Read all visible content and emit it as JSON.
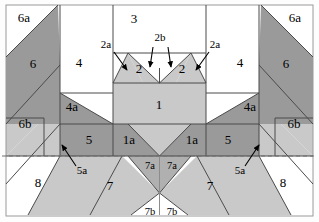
{
  "figure": {
    "width": 319,
    "height": 222,
    "background_color": "#fdfdfd",
    "frame_color": "#9a9a9a",
    "stroke_color": "#4a4a4a",
    "dashed_guide_color": "#707070"
  },
  "palette": {
    "white": "#ffffff",
    "light_gray": "#c9c9c9",
    "mid_gray": "#b0b0b0",
    "dark_gray": "#9a9a9a"
  },
  "regions": [
    {
      "id": "6a-left",
      "label": "6a",
      "fill": "white",
      "x": 24,
      "y": 19
    },
    {
      "id": "6a-right",
      "label": "6a",
      "fill": "white",
      "x": 295,
      "y": 19
    },
    {
      "id": "6-left",
      "label": "6",
      "fill": "dark_gray",
      "x": 33,
      "y": 65
    },
    {
      "id": "6-right",
      "label": "6",
      "fill": "dark_gray",
      "x": 286,
      "y": 65
    },
    {
      "id": "6b-left",
      "label": "6b",
      "fill": "light_gray",
      "x": 25,
      "y": 125
    },
    {
      "id": "6b-right",
      "label": "6b",
      "fill": "light_gray",
      "x": 294,
      "y": 125
    },
    {
      "id": "4-left",
      "label": "4",
      "fill": "white",
      "x": 79,
      "y": 64
    },
    {
      "id": "4-right",
      "label": "4",
      "fill": "white",
      "x": 240,
      "y": 64
    },
    {
      "id": "3",
      "label": "3",
      "fill": "white",
      "x": 134,
      "y": 20
    },
    {
      "id": "2-left",
      "label": "2",
      "fill": "light_gray",
      "x": 139,
      "y": 69
    },
    {
      "id": "2-right",
      "label": "2",
      "fill": "light_gray",
      "x": 182,
      "y": 69
    },
    {
      "id": "1",
      "label": "1",
      "fill": "light_gray",
      "x": 159,
      "y": 106
    },
    {
      "id": "4a-left",
      "label": "4a",
      "fill": "dark_gray",
      "x": 72,
      "y": 108
    },
    {
      "id": "4a-right",
      "label": "4a",
      "fill": "dark_gray",
      "x": 250,
      "y": 108
    },
    {
      "id": "5-left",
      "label": "5",
      "fill": "dark_gray",
      "x": 89,
      "y": 141
    },
    {
      "id": "5-right",
      "label": "5",
      "fill": "dark_gray",
      "x": 228,
      "y": 141
    },
    {
      "id": "1a-left",
      "label": "1a",
      "fill": "dark_gray",
      "x": 129,
      "y": 141
    },
    {
      "id": "1a-right",
      "label": "1a",
      "fill": "dark_gray",
      "x": 192,
      "y": 141
    },
    {
      "id": "7a-left",
      "label": "7a",
      "fill": "mid_gray",
      "x": 150,
      "y": 167
    },
    {
      "id": "7a-right",
      "label": "7a",
      "fill": "mid_gray",
      "x": 172,
      "y": 167
    },
    {
      "id": "7-left",
      "label": "7",
      "fill": "light_gray",
      "x": 110,
      "y": 187
    },
    {
      "id": "7-right",
      "label": "7",
      "fill": "light_gray",
      "x": 210,
      "y": 187
    },
    {
      "id": "7b-left",
      "label": "7b",
      "fill": "white",
      "x": 150,
      "y": 213
    },
    {
      "id": "7b-right",
      "label": "7b",
      "fill": "white",
      "x": 172,
      "y": 213
    },
    {
      "id": "8-left",
      "label": "8",
      "fill": "white",
      "x": 38,
      "y": 184
    },
    {
      "id": "8-right",
      "label": "8",
      "fill": "white",
      "x": 283,
      "y": 184
    }
  ],
  "callouts": [
    {
      "id": "2a-left",
      "label": "2a",
      "text_x": 106,
      "text_y": 45,
      "arrow": "M 114 52 L 128 69"
    },
    {
      "id": "2a-right",
      "label": "2a",
      "text_x": 215,
      "text_y": 45,
      "arrow": "M 209 52 L 194 69"
    },
    {
      "id": "2b-left",
      "label": "2b",
      "text_x": 160,
      "text_y": 40,
      "arrow": "M 153 47 L 150 66"
    },
    {
      "id": "2b-right",
      "label": "2b",
      "text_x": 160,
      "text_y": 40,
      "arrow": "M 168 47 L 170 66"
    },
    {
      "id": "5a-left",
      "label": "5a",
      "text_x": 82,
      "text_y": 170,
      "arrow": "M 74 165 L 61 146"
    },
    {
      "id": "5a-right",
      "label": "5a",
      "text_x": 240,
      "text_y": 170,
      "arrow": "M 247 165 L 261 146"
    }
  ],
  "geometry": {
    "frame": {
      "x": 6,
      "y": 5,
      "w": 307,
      "h": 211
    },
    "dashed_guide_y": 156,
    "center_x": 159.5
  }
}
